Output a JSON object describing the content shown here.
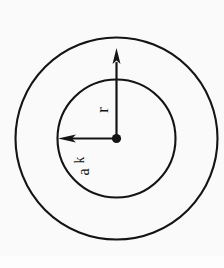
{
  "figure": {
    "background_color": "#fafafa",
    "stroke_color": "#141414",
    "label_color": "#141414",
    "center": {
      "x": 116.5,
      "y": 138.5
    },
    "center_dot": {
      "name": "center-point",
      "radius": 4.6,
      "fill": "#141414"
    },
    "circles": [
      {
        "name": "outer-circle",
        "radius": 101,
        "stroke_width": 2.1,
        "fill": "none"
      },
      {
        "name": "inner-circle",
        "radius": 59,
        "stroke_width": 2.1,
        "fill": "none"
      }
    ],
    "arrows": [
      {
        "name": "radius-arrow-up",
        "label": "r",
        "direction": "up",
        "from": {
          "x": 116.5,
          "y": 138.5
        },
        "to": {
          "x": 116.5,
          "y": 48
        },
        "shaft_width": 2.2,
        "head_width": 8,
        "head_length": 16,
        "label_rotation_deg": -90,
        "label_position": {
          "x": 106,
          "y": 106
        },
        "label_font_size": 17
      },
      {
        "name": "radius-arrow-left",
        "label": "a",
        "label_sub": "k",
        "direction": "left",
        "from": {
          "x": 116.5,
          "y": 138.5
        },
        "to": {
          "x": 58,
          "y": 138.5
        },
        "shaft_width": 2.2,
        "head_width": 8,
        "head_length": 14,
        "label_rotation_deg": -90,
        "label_position": {
          "x": 88,
          "y": 168
        },
        "label_font_size": 16
      }
    ],
    "labels": [
      {
        "name": "label-r",
        "text": "r"
      },
      {
        "name": "label-a-k",
        "text": "a",
        "subscript": "k"
      }
    ]
  }
}
